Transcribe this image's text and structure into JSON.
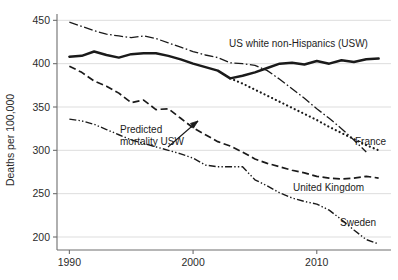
{
  "chart_data": {
    "type": "line",
    "title": "",
    "xlabel": "",
    "ylabel": "Deaths per 100,000",
    "xlim": [
      1989,
      2016
    ],
    "ylim": [
      185,
      455
    ],
    "xticks": [
      "1990",
      "2000",
      "2010"
    ],
    "xtick_values": [
      1990,
      2000,
      2010
    ],
    "yticks": [
      "200",
      "250",
      "300",
      "350",
      "400",
      "450"
    ],
    "ytick_values": [
      200,
      250,
      300,
      350,
      400,
      450
    ],
    "grid": true,
    "legend_position": "inline-labels",
    "annotations": [
      {
        "text_line1": "Predicted",
        "text_line2": "mortality USW",
        "text": "Predicted mortality USW",
        "points_to": "predicted-mortality-usw-series"
      }
    ],
    "series": [
      {
        "name": "US white non-Hispanics (USW)",
        "label": "US white non-Hispanics (USW)",
        "style": "solid-thick",
        "x": [
          1990,
          1991,
          1992,
          1993,
          1994,
          1995,
          1996,
          1997,
          1998,
          1999,
          2000,
          2001,
          2002,
          2003,
          2004,
          2005,
          2006,
          2007,
          2008,
          2009,
          2010,
          2011,
          2012,
          2013,
          2014,
          2015
        ],
        "values": [
          408,
          409,
          414,
          410,
          407,
          411,
          412,
          412,
          409,
          405,
          400,
          396,
          392,
          383,
          386,
          390,
          395,
          400,
          401,
          399,
          403,
          400,
          404,
          402,
          405,
          406
        ]
      },
      {
        "name": "France",
        "label": "France",
        "style": "dash-dot",
        "x": [
          1990,
          1991,
          1992,
          1993,
          1994,
          1995,
          1996,
          1997,
          1998,
          1999,
          2000,
          2001,
          2002,
          2003,
          2004,
          2005,
          2006,
          2007,
          2008,
          2009,
          2010,
          2011,
          2012,
          2013,
          2014
        ],
        "values": [
          448,
          443,
          438,
          434,
          432,
          430,
          432,
          429,
          424,
          419,
          414,
          410,
          407,
          401,
          400,
          398,
          392,
          382,
          371,
          360,
          348,
          337,
          325,
          312,
          298
        ]
      },
      {
        "name": "Predicted mortality USW",
        "label": "",
        "style": "dotted",
        "x": [
          2003,
          2004,
          2005,
          2006,
          2007,
          2008,
          2009,
          2010,
          2011,
          2012,
          2013,
          2014,
          2015
        ],
        "values": [
          383,
          377,
          370,
          363,
          356,
          349,
          342,
          335,
          327,
          320,
          313,
          306,
          300
        ]
      },
      {
        "name": "United Kingdom",
        "label": "United Kingdom",
        "style": "dashed",
        "x": [
          1990,
          1991,
          1992,
          1993,
          1994,
          1995,
          1996,
          1997,
          1998,
          1999,
          2000,
          2001,
          2002,
          2003,
          2004,
          2005,
          2006,
          2007,
          2008,
          2009,
          2010,
          2011,
          2012,
          2013,
          2014,
          2015
        ],
        "values": [
          397,
          390,
          380,
          374,
          366,
          355,
          358,
          347,
          348,
          337,
          326,
          318,
          310,
          305,
          298,
          290,
          285,
          281,
          277,
          274,
          270,
          268,
          267,
          268,
          270,
          268
        ]
      },
      {
        "name": "Sweden",
        "label": "Sweden",
        "style": "dash-dot-dot",
        "x": [
          1990,
          1991,
          1992,
          1993,
          1994,
          1995,
          1996,
          1997,
          1998,
          1999,
          2000,
          2001,
          2002,
          2003,
          2004,
          2005,
          2006,
          2007,
          2008,
          2009,
          2010,
          2011,
          2012,
          2013,
          2014,
          2015
        ],
        "values": [
          336,
          334,
          330,
          324,
          318,
          312,
          308,
          304,
          300,
          296,
          291,
          283,
          281,
          281,
          281,
          266,
          259,
          251,
          245,
          241,
          238,
          231,
          220,
          208,
          197,
          192
        ]
      }
    ]
  },
  "axis": {
    "y_title": "Deaths per 100,000"
  },
  "labels": {
    "usw": "US white non-Hispanics (USW)",
    "france": "France",
    "uk": "United Kingdom",
    "sweden": "Sweden",
    "predicted_l1": "Predicted",
    "predicted_l2": "mortality USW"
  },
  "colors": {
    "line": "#1a1a1a",
    "grid": "#d9d9d9",
    "axis": "#6e6e6e",
    "text": "#242424"
  }
}
